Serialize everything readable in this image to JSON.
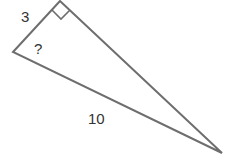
{
  "diagram": {
    "type": "right-triangle",
    "labels": {
      "leg": "3",
      "unknown_angle": "?",
      "hypotenuse": "10"
    },
    "right_angle_marker": true,
    "stroke_color": "#6e6e6e"
  }
}
